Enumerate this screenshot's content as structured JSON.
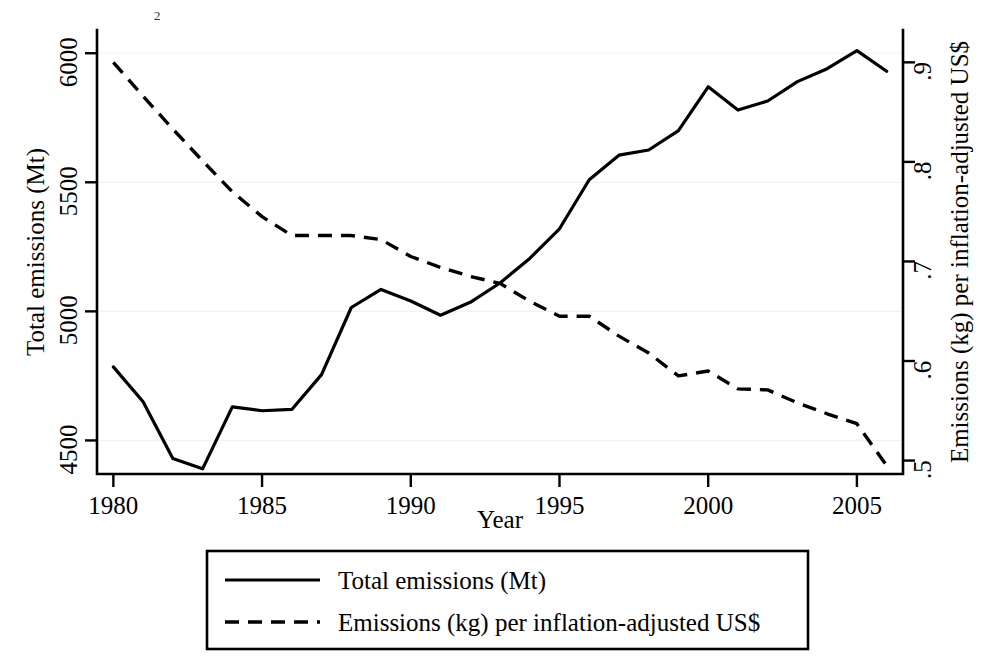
{
  "chart_data": {
    "type": "line",
    "title": "",
    "truncated_top_fragment": "₂",
    "xlabel": "Year",
    "ylabel": "Total emissions (Mt)",
    "y2label": "Emissions (kg) per inflation-adjusted US$",
    "grid": true,
    "legend_position": "below-plot",
    "xlim": [
      1979.45,
      2006.55
    ],
    "ylim": [
      4370,
      6090
    ],
    "y2lim": [
      0.4865,
      0.9325
    ],
    "xticks": [
      1980,
      1985,
      1990,
      1995,
      2000,
      2005
    ],
    "xtick_labels": [
      "1980",
      "1985",
      "1990",
      "1995",
      "2000",
      "2005"
    ],
    "yticks": [
      4500,
      5000,
      5500,
      6000
    ],
    "ytick_labels": [
      "4500",
      "5000",
      "5500",
      "6000"
    ],
    "y2ticks": [
      0.5,
      0.6,
      0.7,
      0.8,
      0.9
    ],
    "y2tick_labels": [
      ".5",
      ".6",
      ".7",
      ".8",
      ".9"
    ],
    "x": [
      1980,
      1981,
      1982,
      1983,
      1984,
      1985,
      1986,
      1987,
      1988,
      1989,
      1990,
      1991,
      1992,
      1993,
      1994,
      1995,
      1996,
      1997,
      1998,
      1999,
      2000,
      2001,
      2002,
      2003,
      2004,
      2005,
      2006
    ],
    "series": [
      {
        "name": "Total emissions (Mt)",
        "axis": "left",
        "style": "solid",
        "values": [
          4785,
          4650,
          4430,
          4390,
          4630,
          4615,
          4620,
          4755,
          5015,
          5085,
          5040,
          4985,
          5035,
          5110,
          5205,
          5320,
          5510,
          5605,
          5625,
          5700,
          5870,
          5780,
          5815,
          5890,
          5940,
          6010,
          5930
        ]
      },
      {
        "name": "Emissions (kg) per inflation-adjusted US$",
        "axis": "right",
        "style": "dashed",
        "values": [
          0.9,
          0.866,
          0.833,
          0.801,
          0.77,
          0.745,
          0.726,
          0.726,
          0.726,
          0.722,
          0.705,
          0.694,
          0.685,
          0.678,
          0.66,
          0.645,
          0.645,
          0.625,
          0.608,
          0.585,
          0.59,
          0.572,
          0.571,
          0.558,
          0.547,
          0.537,
          0.495
        ]
      }
    ],
    "legend": [
      {
        "label": "Total emissions (Mt)",
        "style": "solid"
      },
      {
        "label": "Emissions (kg) per inflation-adjusted US$",
        "style": "dashed"
      }
    ]
  }
}
